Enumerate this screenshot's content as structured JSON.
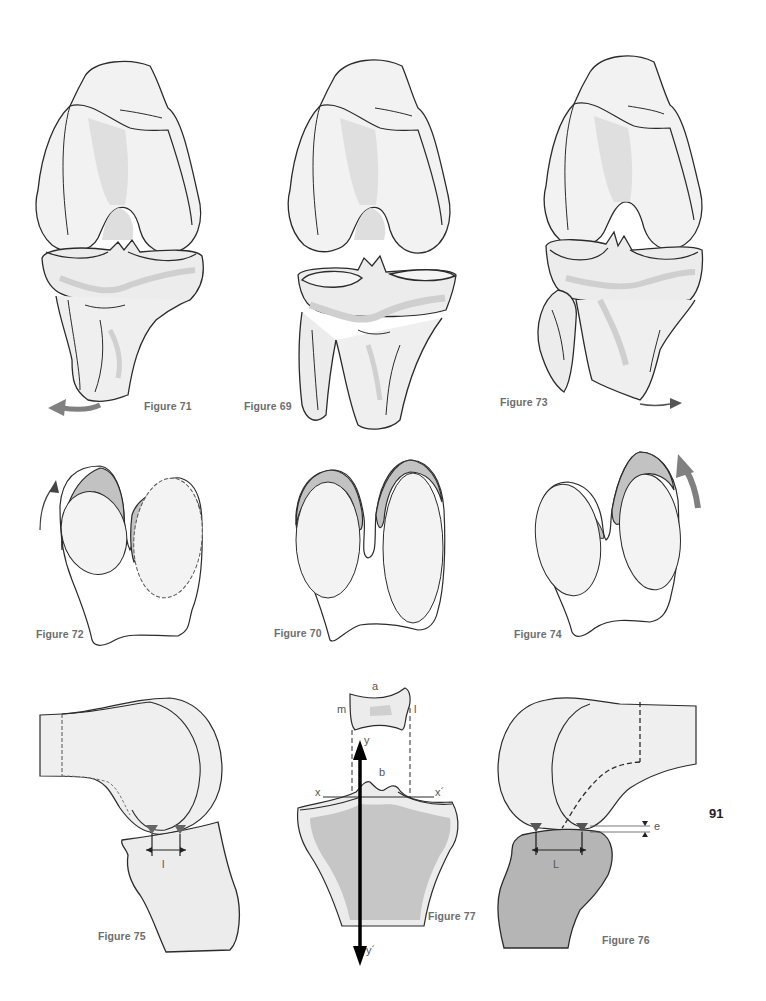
{
  "page": {
    "number": "91",
    "background": "#ffffff"
  },
  "colors": {
    "outline": "#2b2b2b",
    "bone_fill": "#f0f0f0",
    "bone_shade": "#d6d6d6",
    "gray_fill": "#c8c8c8",
    "dark_fill": "#b3b3b3",
    "arrow": "#808080",
    "caption": "#6e6e6e"
  },
  "figures": {
    "fig71": {
      "caption": "Figure 71",
      "arrow": "rotation-arrow-left"
    },
    "fig69": {
      "caption": "Figure 69"
    },
    "fig73": {
      "caption": "Figure 73",
      "arrow": "rotation-arrow-right"
    },
    "fig72": {
      "caption": "Figure 72",
      "arrow": "rotation-arrow-up-left"
    },
    "fig70": {
      "caption": "Figure 70"
    },
    "fig74": {
      "caption": "Figure 74",
      "arrow": "rotation-arrow-up-right"
    },
    "fig75": {
      "caption": "Figure 75",
      "labels": {
        "l": "l"
      }
    },
    "fig77": {
      "caption": "Figure 77",
      "labels": {
        "a": "a",
        "b": "b",
        "m": "m",
        "l": "l",
        "x": "x",
        "x_prime": "x´",
        "y": "y",
        "y_prime": "y´"
      }
    },
    "fig76": {
      "caption": "Figure 76",
      "labels": {
        "L": "L",
        "e": "e"
      }
    }
  }
}
